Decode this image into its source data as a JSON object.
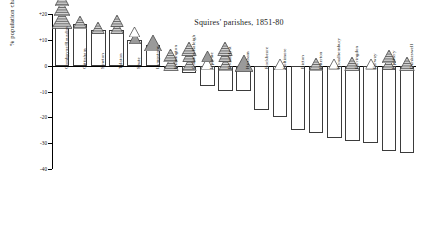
{
  "chart_data": {
    "type": "bar",
    "title": "Squires' parishes, 1851-80",
    "xlabel": "",
    "ylabel": "% population change",
    "ylim": [
      -40,
      20
    ],
    "yticks": [
      "+20",
      "+10",
      "0",
      "-10",
      "-20",
      "-30",
      "-40"
    ],
    "ytick_values": [
      20,
      10,
      0,
      -10,
      -20,
      -30,
      -40
    ],
    "grid": false,
    "legend": "none",
    "categories": [
      "Combpyne/Rousdon",
      "Gittisham",
      "Sowton",
      "Talaton",
      "Shute",
      "Lympstone",
      "Kilmington",
      "Colaton Raleigh",
      "Uplyme",
      "Broadclyst",
      "Huxham",
      "Rockbeare",
      "Poltimore",
      "Bicton",
      "Otterton",
      "Broadhembury",
      "Farringdon",
      "Farway",
      "Upottery",
      "Dunkeswell"
    ],
    "values": [
      17,
      16,
      14,
      14,
      10,
      8,
      0,
      -3,
      -8,
      -10,
      -10,
      -17,
      -20,
      -25,
      -26,
      -28,
      -29,
      -30,
      -33,
      -34
    ],
    "markers": [
      {
        "category": "Combpyne/Rousdon",
        "triangles": [
          {
            "fill": "hatched",
            "size": 20
          },
          {
            "fill": "hatched",
            "size": 16
          },
          {
            "fill": "hatched",
            "size": 14
          },
          {
            "fill": "white",
            "size": 17
          }
        ]
      },
      {
        "category": "Gittisham",
        "triangles": [
          {
            "fill": "hatched",
            "size": 14
          }
        ]
      },
      {
        "category": "Sowton",
        "triangles": [
          {
            "fill": "hatched",
            "size": 13
          }
        ]
      },
      {
        "category": "Talaton",
        "triangles": [
          {
            "fill": "hatched",
            "size": 13
          },
          {
            "fill": "hatched",
            "size": 13
          }
        ]
      },
      {
        "category": "Shute",
        "triangles": [
          {
            "fill": "gray",
            "size": 12
          },
          {
            "fill": "white",
            "size": 11
          }
        ]
      },
      {
        "category": "Lympstone",
        "triangles": [
          {
            "fill": "gray",
            "size": 18
          }
        ]
      },
      {
        "category": "Kilmington",
        "triangles": [
          {
            "fill": "hatched",
            "size": 15
          },
          {
            "fill": "hatched",
            "size": 14
          }
        ]
      },
      {
        "category": "Colaton Raleigh",
        "triangles": [
          {
            "fill": "hatched",
            "size": 14
          },
          {
            "fill": "hatched",
            "size": 13
          },
          {
            "fill": "hatched",
            "size": 15
          }
        ]
      },
      {
        "category": "Uplyme",
        "triangles": [
          {
            "fill": "white",
            "size": 13
          },
          {
            "fill": "gray",
            "size": 12
          }
        ]
      },
      {
        "category": "Broadclyst",
        "triangles": [
          {
            "fill": "hatched",
            "size": 14
          },
          {
            "fill": "hatched",
            "size": 13
          },
          {
            "fill": "hatched",
            "size": 15
          }
        ]
      },
      {
        "category": "Huxham",
        "triangles": [
          {
            "fill": "gray",
            "size": 18
          }
        ]
      },
      {
        "category": "Rockbeare",
        "triangles": []
      },
      {
        "category": "Poltimore",
        "triangles": [
          {
            "fill": "white",
            "size": 12
          }
        ]
      },
      {
        "category": "Bicton",
        "triangles": []
      },
      {
        "category": "Otterton",
        "triangles": [
          {
            "fill": "hatched",
            "size": 14
          }
        ]
      },
      {
        "category": "Broadhembury",
        "triangles": [
          {
            "fill": "white",
            "size": 11
          }
        ]
      },
      {
        "category": "Farringdon",
        "triangles": [
          {
            "fill": "hatched",
            "size": 15
          }
        ]
      },
      {
        "category": "Farway",
        "triangles": [
          {
            "fill": "white",
            "size": 11
          }
        ]
      },
      {
        "category": "Upottery",
        "triangles": [
          {
            "fill": "hatched",
            "size": 13
          },
          {
            "fill": "hatched",
            "size": 14
          }
        ]
      },
      {
        "category": "Dunkeswell",
        "triangles": [
          {
            "fill": "hatched",
            "size": 15
          }
        ]
      }
    ],
    "colors": {
      "outline": "#3b3b3b",
      "bar_fill": "#ffffff",
      "gray_fill": "#9a9a9a",
      "hatch": "#2b2b2b",
      "axis": "#000000"
    }
  }
}
